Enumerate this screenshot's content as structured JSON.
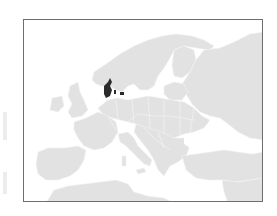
{
  "map": {
    "region": "Europe",
    "highlighted_country": "Denmark",
    "colors": {
      "land": "#e2e2e2",
      "highlight": "#2b2b2b",
      "water": "#ffffff",
      "frame": "#6e6e6e"
    }
  }
}
